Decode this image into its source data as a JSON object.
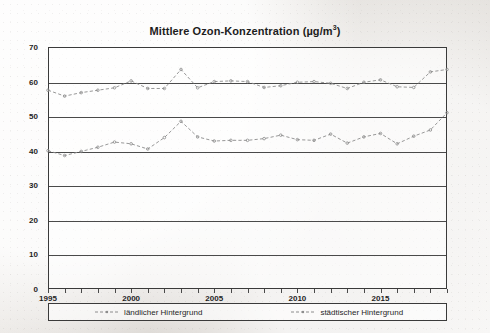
{
  "chart_data": {
    "type": "line",
    "title_main": "Mittlere Ozon-Konzentration (µg/m",
    "title_sup": "3",
    "title_tail": ")",
    "xlabel": "",
    "ylabel": "",
    "ylim": [
      0,
      70
    ],
    "xlim": [
      1995,
      2019
    ],
    "ytick_step": 10,
    "yticks": [
      70,
      60,
      50,
      40,
      30,
      20,
      10,
      0
    ],
    "xticks": [
      1995,
      2000,
      2005,
      2010,
      2015
    ],
    "x": [
      1995,
      1996,
      1997,
      1998,
      1999,
      2000,
      2001,
      2002,
      2003,
      2004,
      2005,
      2006,
      2007,
      2008,
      2009,
      2010,
      2011,
      2012,
      2013,
      2014,
      2015,
      2016,
      2017,
      2018,
      2019
    ],
    "grid": true,
    "grid_axis": "y",
    "legend_position": "bottom",
    "line_style": "dashed-with-markers",
    "series": [
      {
        "name": "städtischer Hintergrund",
        "legend_key": "staedtischer",
        "color": "#8c8c8c",
        "values": [
          57.5,
          55.8,
          56.8,
          57.5,
          58.2,
          60.2,
          58.0,
          58.0,
          63.5,
          58.2,
          60.0,
          60.2,
          60.0,
          58.3,
          58.8,
          59.8,
          60.0,
          59.5,
          58.0,
          59.8,
          60.5,
          58.5,
          58.3,
          62.8,
          63.5
        ]
      },
      {
        "name": "ländlicher Hintergrund",
        "legend_key": "laendlicher",
        "color": "#8c8c8c",
        "values": [
          40.0,
          38.6,
          39.8,
          41.0,
          42.5,
          42.0,
          40.5,
          43.8,
          48.5,
          44.0,
          42.8,
          43.0,
          43.0,
          43.5,
          44.5,
          43.2,
          43.0,
          44.8,
          42.2,
          44.0,
          45.0,
          42.0,
          44.2,
          46.0,
          51.0
        ]
      }
    ]
  },
  "legend": {
    "items": [
      {
        "label": "ländlicher Hintergrund"
      },
      {
        "label": "städtischer Hintergrund"
      }
    ]
  }
}
